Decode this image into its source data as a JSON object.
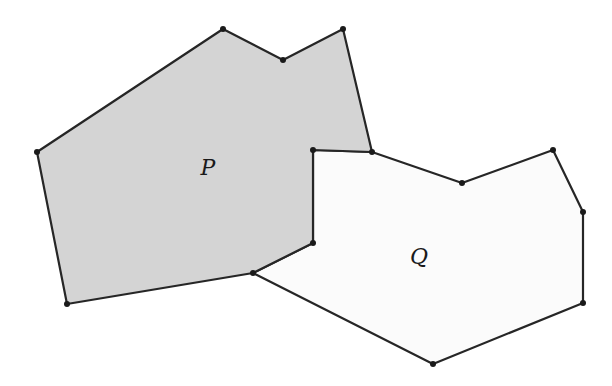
{
  "figure": {
    "width": 612,
    "height": 386,
    "colors": {
      "background": "#ffffff",
      "p_fill": "#d4d4d4",
      "q_fill": "#fbfbfb",
      "stroke": "#262626",
      "vertex": "#1a1a1a"
    },
    "polygons": [
      {
        "id": "P",
        "label": "P",
        "shaded": true,
        "vertices": [
          [
            37,
            152
          ],
          [
            223,
            29
          ],
          [
            283,
            60
          ],
          [
            343,
            29
          ],
          [
            372,
            152
          ],
          [
            313,
            150
          ],
          [
            313,
            243
          ],
          [
            253,
            273
          ],
          [
            67,
            304
          ]
        ],
        "label_pos": [
          208,
          175
        ]
      },
      {
        "id": "Q",
        "label": "Q",
        "shaded": false,
        "vertices": [
          [
            313,
            150
          ],
          [
            372,
            152
          ],
          [
            462,
            183
          ],
          [
            553,
            150
          ],
          [
            583,
            212
          ],
          [
            583,
            303
          ],
          [
            433,
            364
          ],
          [
            253,
            273
          ],
          [
            313,
            243
          ]
        ],
        "label_pos": [
          419,
          264
        ]
      }
    ]
  }
}
